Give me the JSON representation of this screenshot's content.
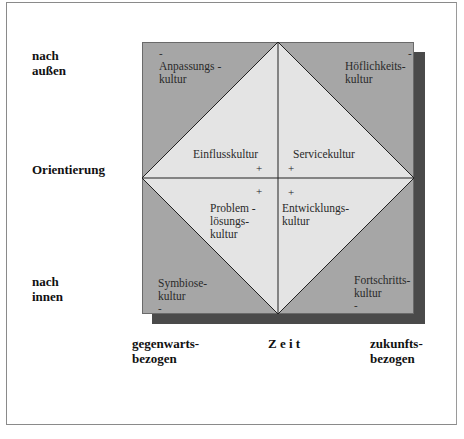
{
  "diagram": {
    "y_axis": {
      "top_label_line1": "nach",
      "top_label_line2": "außen",
      "middle_label": "Orientierung",
      "bottom_label_line1": "nach",
      "bottom_label_line2": "innen"
    },
    "x_axis": {
      "left_label_line1": "gegenwarts-",
      "left_label_line2": "bezogen",
      "middle_label": "Z e i t",
      "right_label_line1": "zukunfts-",
      "right_label_line2": "bezogen"
    },
    "corners": {
      "top_left": {
        "line1": "Anpassungs -",
        "line2": "kultur",
        "sign": "-"
      },
      "top_right": {
        "line1": "Höflichkeits-",
        "line2": "kultur",
        "sign": "-"
      },
      "bottom_left": {
        "line1": "Symbiose-",
        "line2": "kultur",
        "sign": "-"
      },
      "bottom_right": {
        "line1": "Fortschritts-",
        "line2": "kultur",
        "sign": "-"
      }
    },
    "inner": {
      "top_left": {
        "line1": "Einflusskultur",
        "sign": "+"
      },
      "top_right": {
        "line1": "Servicekultur",
        "sign": "+"
      },
      "bottom_left": {
        "line1": "Problem -",
        "line2": "lösungs-",
        "line3": "kultur",
        "sign": "+"
      },
      "bottom_right": {
        "line1": "Entwicklungs-",
        "line2": "kultur",
        "sign": "+"
      }
    },
    "colors": {
      "outer_gray": "#a6a6a6",
      "inner_light": "#e4e4e4",
      "shadow": "#4a4a4a"
    }
  }
}
